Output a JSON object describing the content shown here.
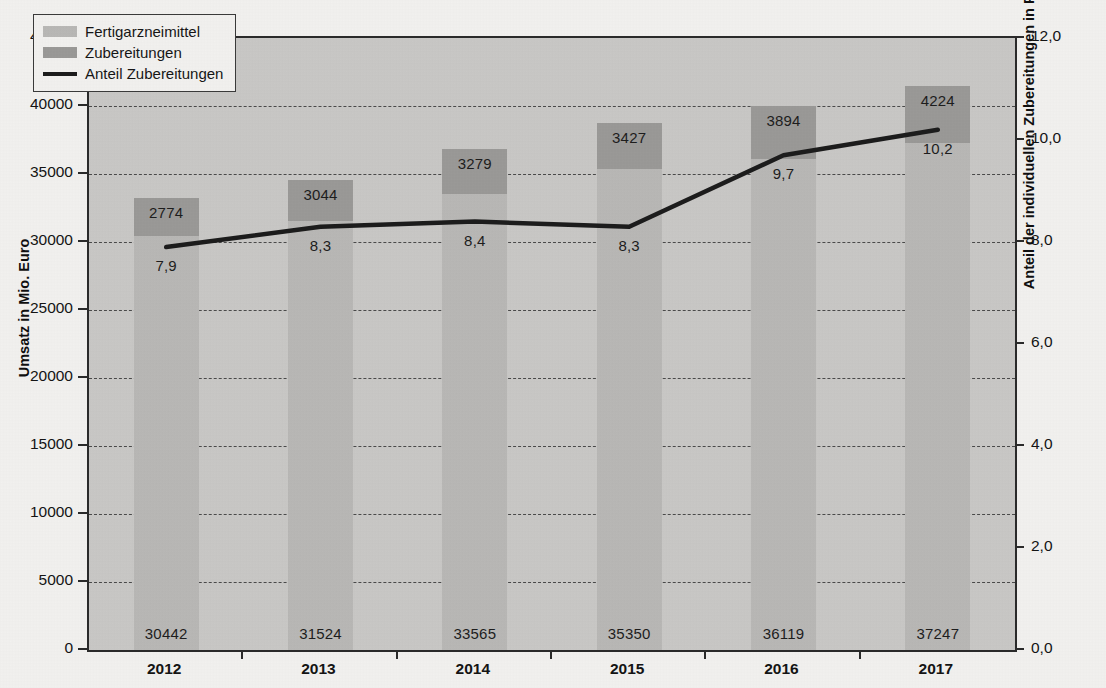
{
  "chart_data": {
    "type": "bar",
    "subtype": "stacked-bar-with-line",
    "title": "",
    "categories": [
      "2012",
      "2013",
      "2014",
      "2015",
      "2016",
      "2017"
    ],
    "series": [
      {
        "name": "Fertigarzneimittel",
        "axis": "left",
        "color": "#b9b8b6",
        "values": [
          30442,
          31524,
          33565,
          35350,
          36119,
          37247
        ],
        "value_labels": [
          "30442",
          "31524",
          "33565",
          "35350",
          "36119",
          "37247"
        ]
      },
      {
        "name": "Zubereitungen",
        "axis": "left",
        "color": "#9a9997",
        "values": [
          2774,
          3044,
          3279,
          3427,
          3894,
          4224
        ],
        "value_labels": [
          "2774",
          "3044",
          "3279",
          "3427",
          "3894",
          "4224"
        ]
      },
      {
        "name": "Anteil Zubereitungen",
        "axis": "right",
        "color": "#1c1c1c",
        "values": [
          7.9,
          8.3,
          8.4,
          8.3,
          9.7,
          10.2
        ],
        "value_labels": [
          "7,9",
          "8,3",
          "8,4",
          "8,3",
          "9,7",
          "10,2"
        ]
      }
    ],
    "totals": [
      33216,
      34568,
      36844,
      38777,
      40013,
      41471
    ],
    "xlabel": "",
    "ylabel": "Umsatz in Mio. Euro",
    "ylabel_right": "Anteil der individuellen Zubereitungen in Prozent",
    "ylim": [
      0,
      45000
    ],
    "ylim_right": [
      0,
      12
    ],
    "yticks": [
      "0",
      "5000",
      "10000",
      "15000",
      "20000",
      "25000",
      "30000",
      "35000",
      "40000",
      "45000"
    ],
    "ytick_values": [
      0,
      5000,
      10000,
      15000,
      20000,
      25000,
      30000,
      35000,
      40000,
      45000
    ],
    "yticks_right": [
      "0,0",
      "2,0",
      "4,0",
      "6,0",
      "8,0",
      "10,0",
      "12,0"
    ],
    "ytick_values_right": [
      0,
      2,
      4,
      6,
      8,
      10,
      12
    ],
    "grid": true,
    "grid_style": "dashed",
    "legend_position": "top-left",
    "plot_background": "#c9c8c6"
  },
  "legend": {
    "items": [
      {
        "label": "Fertigarzneimittel",
        "marker": "swatch",
        "color": "#b9b8b6"
      },
      {
        "label": "Zubereitungen",
        "marker": "swatch",
        "color": "#9a9997"
      },
      {
        "label": "Anteil Zubereitungen",
        "marker": "line",
        "color": "#1c1c1c"
      }
    ]
  },
  "axes": {
    "left_title": "Umsatz in Mio. Euro",
    "right_title": "Anteil der individuellen Zubereitungen in Prozent"
  }
}
